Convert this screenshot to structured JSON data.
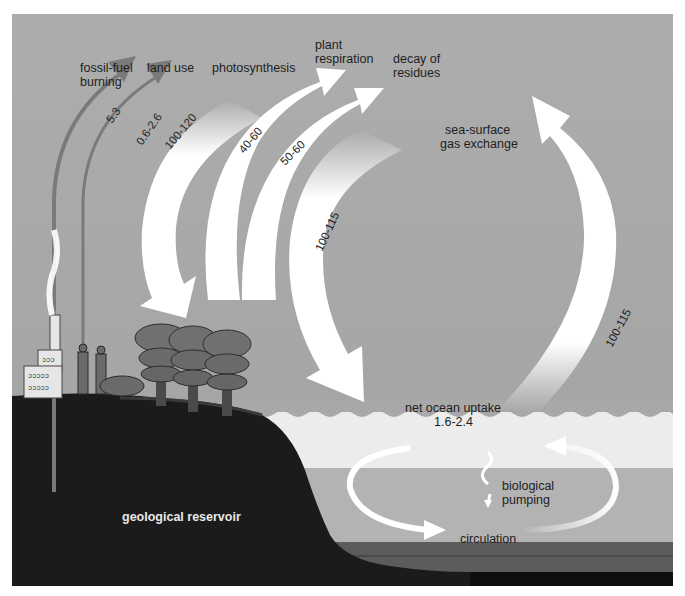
{
  "diagram": {
    "colors": {
      "sky": "#a9a9a9",
      "surface_water": "#ececec",
      "mid_water": "#b4b4b4",
      "deep_water": "#5a5a5a",
      "sea_floor": "#111111",
      "land": "#1c1c1c",
      "flux_arrow": "#ffffff",
      "anthropogenic_arrow": "#7a7a7a"
    },
    "labels": {
      "fossil_fuel": [
        "fossil-fuel",
        "burning"
      ],
      "land_use": "land use",
      "photosynthesis": "photosynthesis",
      "plant_respiration": [
        "plant",
        "respiration"
      ],
      "decay": [
        "decay of",
        "residues"
      ],
      "sea_surface": [
        "sea-surface",
        "gas exchange"
      ],
      "net_ocean_uptake": [
        "net ocean uptake",
        "1.6-2.4"
      ],
      "biological_pumping": [
        "biological",
        "pumping"
      ],
      "circulation": "circulation",
      "geological_reservoir": "geological reservoir"
    },
    "fluxes": [
      {
        "name": "fossil-fuel burning",
        "value": "5.3",
        "direction": "to atmosphere"
      },
      {
        "name": "land use",
        "value": "0.6-2.6",
        "direction": "to atmosphere"
      },
      {
        "name": "photosynthesis",
        "value": "100-120",
        "direction": "to land"
      },
      {
        "name": "plant respiration",
        "value": "40-60",
        "direction": "to atmosphere"
      },
      {
        "name": "decay of residues",
        "value": "50-60",
        "direction": "to atmosphere"
      },
      {
        "name": "sea-surface gas exchange (down)",
        "value": "100-115",
        "direction": "to ocean"
      },
      {
        "name": "sea-surface gas exchange (up)",
        "value": "100-115",
        "direction": "to atmosphere"
      },
      {
        "name": "net ocean uptake",
        "value": "1.6-2.4",
        "direction": "to ocean"
      }
    ]
  }
}
